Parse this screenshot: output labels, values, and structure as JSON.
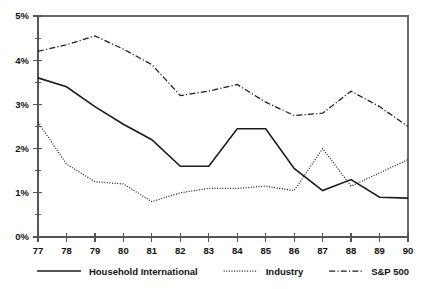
{
  "chart_data": {
    "type": "line",
    "title": "",
    "subtitle": "",
    "xlabel": "",
    "ylabel": "",
    "x": [
      "77",
      "78",
      "79",
      "80",
      "81",
      "82",
      "83",
      "84",
      "85",
      "86",
      "87",
      "88",
      "89",
      "90"
    ],
    "xlim": [
      77,
      90
    ],
    "ylim": [
      0,
      5
    ],
    "y_unit": "%",
    "y_ticks": [
      "0%",
      "1%",
      "2%",
      "3%",
      "4%",
      "5%"
    ],
    "y_tick_values": [
      0,
      1,
      2,
      3,
      4,
      5
    ],
    "y_minor_tick_values": [
      0.5,
      1.5,
      2.5,
      3.5,
      4.5
    ],
    "grid": false,
    "legend_position": "bottom",
    "series": [
      {
        "name": "Household International",
        "style": "solid",
        "color": "#1c1c1c",
        "values": [
          3.6,
          3.4,
          2.95,
          2.55,
          2.2,
          1.6,
          1.6,
          2.45,
          2.45,
          1.55,
          1.05,
          1.3,
          0.9,
          0.88
        ]
      },
      {
        "name": "Industry",
        "style": "dotted",
        "color": "#1c1c1c",
        "values": [
          2.6,
          1.65,
          1.25,
          1.2,
          0.8,
          1.0,
          1.1,
          1.1,
          1.15,
          1.05,
          2.0,
          1.15,
          1.45,
          1.75
        ]
      },
      {
        "name": "S&P 500",
        "style": "dash-dot",
        "color": "#1c1c1c",
        "values": [
          4.2,
          4.35,
          4.55,
          4.25,
          3.9,
          3.2,
          3.3,
          3.45,
          3.05,
          2.75,
          2.8,
          3.3,
          2.95,
          2.5
        ]
      }
    ]
  },
  "legend": {
    "items": [
      {
        "label": "Household International",
        "style": "solid"
      },
      {
        "label": "Industry",
        "style": "dotted"
      },
      {
        "label": "S&P 500",
        "style": "dash-dot"
      }
    ]
  }
}
